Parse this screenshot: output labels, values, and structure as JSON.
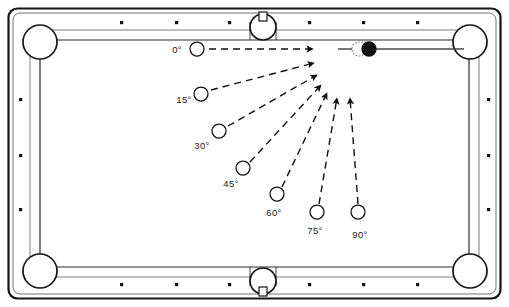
{
  "diagram": {
    "type": "billiards-shot-angles",
    "table": {
      "name": "pool-table",
      "outer_rect": {
        "x": 8,
        "y": 8,
        "width": 493,
        "height": 291
      },
      "rail_color": "#ffffff",
      "line_color": "#1a1a1a",
      "cloth_color": "#ffffff",
      "playfield_rect": {
        "x": 40,
        "y": 40,
        "width": 429,
        "height": 227
      },
      "diamond_color": "#111111",
      "diamond_count_long_rail": 3,
      "diamond_count_short_rail": 3
    },
    "pockets": [
      {
        "name": "pocket-top-left",
        "cx": 40,
        "cy": 42,
        "r": 17
      },
      {
        "name": "pocket-top-middle",
        "cx": 263,
        "cy": 27,
        "r": 13
      },
      {
        "name": "pocket-top-right",
        "cx": 470,
        "cy": 42,
        "r": 17
      },
      {
        "name": "pocket-bottom-left",
        "cx": 40,
        "cy": 271,
        "r": 17
      },
      {
        "name": "pocket-bottom-middle",
        "cx": 263,
        "cy": 281,
        "r": 13
      },
      {
        "name": "pocket-bottom-right",
        "cx": 470,
        "cy": 271,
        "r": 17
      }
    ],
    "object_ball": {
      "name": "object-ball",
      "cx": 369,
      "cy": 49,
      "r": 7,
      "style": "striped",
      "stripe_color": "#111111"
    },
    "ghost_ball": {
      "name": "ghost-ball",
      "cx": 359,
      "cy": 49,
      "r": 7,
      "style": "dotted-outline"
    },
    "target_pocket_line": {
      "name": "object-ball-to-pocket-line",
      "x1": 338,
      "y1": 49,
      "x2": 464,
      "y2": 49
    },
    "cut_shots": [
      {
        "label": "0°",
        "angle_deg": 0,
        "cue_ball": {
          "cx": 197,
          "cy": 49,
          "r": 7
        },
        "label_pos": {
          "x": 177,
          "y": 50
        },
        "arrow": {
          "x1": 209,
          "y1": 49,
          "x2": 313,
          "y2": 49
        }
      },
      {
        "label": "15°",
        "angle_deg": 15,
        "cue_ball": {
          "cx": 201,
          "cy": 94,
          "r": 7
        },
        "label_pos": {
          "x": 184,
          "y": 100
        },
        "arrow": {
          "x1": 211,
          "y1": 90,
          "x2": 314,
          "y2": 63
        }
      },
      {
        "label": "30°",
        "angle_deg": 30,
        "cue_ball": {
          "cx": 219,
          "cy": 131,
          "r": 7
        },
        "label_pos": {
          "x": 202,
          "y": 146
        },
        "arrow": {
          "x1": 228,
          "y1": 126,
          "x2": 317,
          "y2": 75
        }
      },
      {
        "label": "45°",
        "angle_deg": 45,
        "cue_ball": {
          "cx": 243,
          "cy": 168,
          "r": 7
        },
        "label_pos": {
          "x": 231,
          "y": 184
        },
        "arrow": {
          "x1": 250,
          "y1": 162,
          "x2": 321,
          "y2": 85
        }
      },
      {
        "label": "60°",
        "angle_deg": 60,
        "cue_ball": {
          "cx": 277,
          "cy": 194,
          "r": 7
        },
        "label_pos": {
          "x": 274,
          "y": 213
        },
        "arrow": {
          "x1": 282,
          "y1": 187,
          "x2": 327,
          "y2": 93
        }
      },
      {
        "label": "75°",
        "angle_deg": 75,
        "cue_ball": {
          "cx": 317,
          "cy": 212,
          "r": 7
        },
        "label_pos": {
          "x": 315,
          "y": 231
        },
        "arrow": {
          "x1": 319,
          "y1": 204,
          "x2": 337,
          "y2": 98
        }
      },
      {
        "label": "90°",
        "angle_deg": 90,
        "cue_ball": {
          "cx": 358,
          "cy": 212,
          "r": 7
        },
        "label_pos": {
          "x": 360,
          "y": 235
        },
        "arrow": {
          "x1": 358,
          "y1": 204,
          "x2": 350,
          "y2": 98
        }
      }
    ],
    "legend": {
      "dash_pattern": "7 5",
      "stroke_color": "#111111",
      "stroke_width": 1.4
    }
  }
}
